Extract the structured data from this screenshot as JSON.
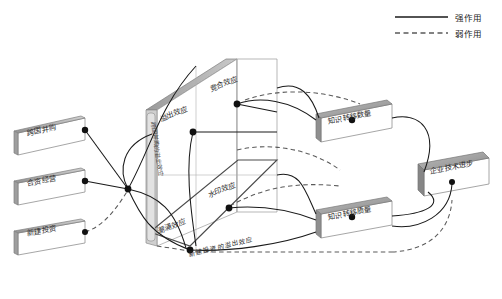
{
  "figure": {
    "title": "",
    "type": "3d-mechanism-diagram"
  },
  "legend": {
    "items": [
      {
        "label": "强作用",
        "style": "solid",
        "color": "#1a1a1a"
      },
      {
        "label": "弱作用",
        "style": "dashed",
        "color": "#555555"
      }
    ]
  },
  "input_boxes": [
    {
      "label": "跨国并购"
    },
    {
      "label": "合资经营"
    },
    {
      "label": "新建投资"
    }
  ],
  "panel": {
    "axis_label": "跨国并购的溢出效应",
    "bottom_label": "新建投资的溢出效应",
    "nodes": [
      {
        "label": "溢出效应"
      },
      {
        "label": "竞合效应"
      },
      {
        "label": "水印效应"
      },
      {
        "label": "潮涌效应"
      }
    ]
  },
  "output_boxes": [
    {
      "label": "知识转移数量"
    },
    {
      "label": "知识转移质量"
    }
  ],
  "result_box": {
    "label": "企业技术进步"
  },
  "colors": {
    "stroke": "#1a1a1a",
    "weak_stroke": "#666666",
    "plate_face": "#ffffff",
    "plate_edge": "#8c8c8c",
    "plate_shade": "#a8a8a8",
    "plate_shade_dark": "#6e6e6e"
  }
}
